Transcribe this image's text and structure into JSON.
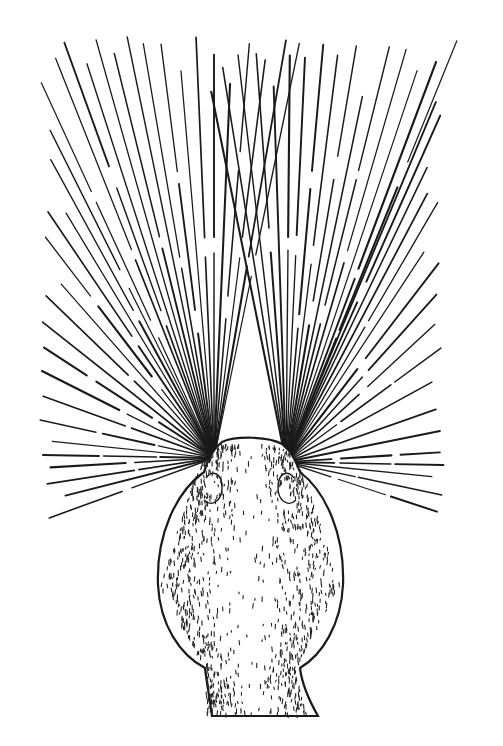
{
  "canvas": {
    "width": 503,
    "height": 746,
    "background": "#ffffff"
  },
  "illustration": {
    "subject": "animal head viewed from above with radiating vibrissae (whiskers)",
    "ink_color": "#1a1a1a",
    "left_whisker_origin": {
      "x": 214,
      "y": 458
    },
    "right_whisker_origin": {
      "x": 286,
      "y": 462
    },
    "left_whisker_tips": [
      [
        46,
        34
      ],
      [
        62,
        36
      ],
      [
        78,
        36
      ],
      [
        95,
        36
      ],
      [
        110,
        36
      ],
      [
        127,
        36
      ],
      [
        142,
        36
      ],
      [
        160,
        36
      ],
      [
        178,
        36
      ],
      [
        196,
        36
      ],
      [
        214,
        38
      ],
      [
        232,
        38
      ],
      [
        250,
        36
      ],
      [
        268,
        38
      ],
      [
        286,
        40
      ],
      [
        300,
        40
      ],
      [
        40,
        80
      ],
      [
        40,
        110
      ],
      [
        40,
        140
      ],
      [
        40,
        170
      ],
      [
        40,
        200
      ],
      [
        40,
        230
      ],
      [
        40,
        260
      ],
      [
        40,
        290
      ],
      [
        40,
        320
      ],
      [
        40,
        345
      ],
      [
        40,
        370
      ],
      [
        40,
        395
      ],
      [
        40,
        420
      ],
      [
        40,
        440
      ],
      [
        40,
        455
      ],
      [
        40,
        468
      ],
      [
        40,
        485
      ],
      [
        40,
        502
      ],
      [
        38,
        522
      ]
    ],
    "right_whisker_tips": [
      [
        200,
        36
      ],
      [
        218,
        38
      ],
      [
        236,
        38
      ],
      [
        255,
        36
      ],
      [
        272,
        36
      ],
      [
        290,
        36
      ],
      [
        306,
        36
      ],
      [
        324,
        36
      ],
      [
        340,
        36
      ],
      [
        358,
        36
      ],
      [
        375,
        36
      ],
      [
        392,
        36
      ],
      [
        410,
        36
      ],
      [
        428,
        38
      ],
      [
        445,
        38
      ],
      [
        458,
        38
      ],
      [
        445,
        80
      ],
      [
        445,
        105
      ],
      [
        445,
        130
      ],
      [
        445,
        160
      ],
      [
        445,
        190
      ],
      [
        445,
        220
      ],
      [
        445,
        255
      ],
      [
        445,
        285
      ],
      [
        445,
        315
      ],
      [
        445,
        345
      ],
      [
        445,
        375
      ],
      [
        448,
        405
      ],
      [
        445,
        430
      ],
      [
        445,
        452
      ],
      [
        445,
        465
      ],
      [
        445,
        478
      ],
      [
        442,
        495
      ],
      [
        438,
        512
      ]
    ],
    "head": {
      "snout_top": {
        "left": 222,
        "right": 280,
        "y": 440
      },
      "widest": {
        "left": 157,
        "right": 343,
        "y": 580
      },
      "neck_bottom": {
        "left": 210,
        "right": 315,
        "y": 717
      }
    }
  }
}
